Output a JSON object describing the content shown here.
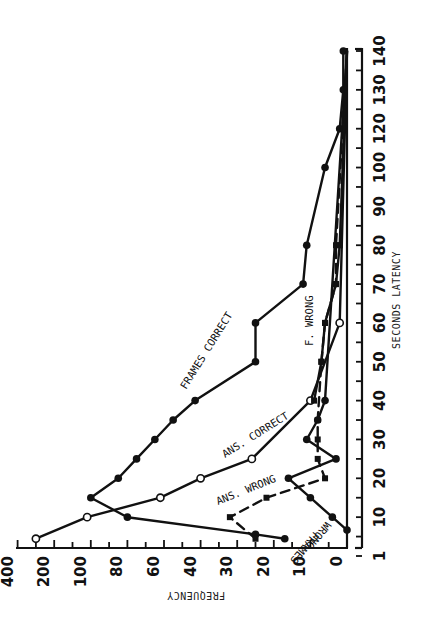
{
  "chart_data": {
    "type": "line",
    "orientation": "rotated 90 degrees clockwise (x-axis vertical on right, y-axis horizontal at bottom)",
    "title": "",
    "xlabel": "SECONDS LATENCY",
    "ylabel": "FREQUENCY",
    "x_tick_labels": [
      "1",
      "10",
      "20",
      "30",
      "40",
      "50",
      "60",
      "70",
      "80",
      "90",
      "100",
      "120",
      "130",
      "140"
    ],
    "y_tick_labels": [
      "0",
      "10",
      "20",
      "30",
      "40",
      "60",
      "80",
      "100",
      "200",
      "400"
    ],
    "y_scale": "nonuniform (tick labels evenly spaced)",
    "xlim": [
      1,
      140
    ],
    "ylim": [
      0,
      400
    ],
    "grid": false,
    "legend": "inline curve labels",
    "series": [
      {
        "name": "FRAMES CORRECT",
        "marker": "filled circle",
        "line": "solid",
        "points": [
          {
            "x": 5,
            "y": 17
          },
          {
            "x": 6,
            "y": 25
          },
          {
            "x": 10,
            "y": 80
          },
          {
            "x": 15,
            "y": 100
          },
          {
            "x": 20,
            "y": 85
          },
          {
            "x": 25,
            "y": 75
          },
          {
            "x": 30,
            "y": 65
          },
          {
            "x": 35,
            "y": 55
          },
          {
            "x": 40,
            "y": 43
          },
          {
            "x": 50,
            "y": 25
          },
          {
            "x": 60,
            "y": 25
          },
          {
            "x": 70,
            "y": 12
          },
          {
            "x": 80,
            "y": 11
          },
          {
            "x": 100,
            "y": 6
          },
          {
            "x": 120,
            "y": 2
          },
          {
            "x": 130,
            "y": 1
          },
          {
            "x": 140,
            "y": 1
          }
        ]
      },
      {
        "name": "ANS. CORRECT",
        "marker": "open circle",
        "line": "solid",
        "points": [
          {
            "x": 5,
            "y": 300
          },
          {
            "x": 10,
            "y": 110
          },
          {
            "x": 15,
            "y": 62
          },
          {
            "x": 20,
            "y": 40
          },
          {
            "x": 25,
            "y": 26
          },
          {
            "x": 40,
            "y": 10
          },
          {
            "x": 60,
            "y": 2
          },
          {
            "x": 140,
            "y": 0
          }
        ]
      },
      {
        "name": "ANS. WRONG",
        "marker": "filled square",
        "line": "dashed",
        "points": [
          {
            "x": 5,
            "y": 25
          },
          {
            "x": 10,
            "y": 32
          },
          {
            "x": 15,
            "y": 22
          },
          {
            "x": 20,
            "y": 6
          },
          {
            "x": 25,
            "y": 8
          },
          {
            "x": 30,
            "y": 8
          },
          {
            "x": 35,
            "y": 8
          },
          {
            "x": 50,
            "y": 7
          },
          {
            "x": 60,
            "y": 6
          },
          {
            "x": 70,
            "y": 3
          },
          {
            "x": 80,
            "y": 3
          },
          {
            "x": 140,
            "y": 0
          }
        ]
      },
      {
        "name": "FRAMES WRONG",
        "marker": "filled circle",
        "line": "solid",
        "points": [
          {
            "x": 7,
            "y": 0
          },
          {
            "x": 10,
            "y": 4
          },
          {
            "x": 15,
            "y": 10
          },
          {
            "x": 20,
            "y": 16
          },
          {
            "x": 25,
            "y": 3
          },
          {
            "x": 30,
            "y": 11
          },
          {
            "x": 35,
            "y": 8
          },
          {
            "x": 40,
            "y": 6
          },
          {
            "x": 140,
            "y": 0
          }
        ]
      },
      {
        "name": "F. WRONG",
        "marker": "filled square",
        "line": "solid",
        "points": [
          {
            "x": 40,
            "y": 9
          },
          {
            "x": 50,
            "y": 7
          },
          {
            "x": 60,
            "y": 6
          },
          {
            "x": 70,
            "y": 3
          },
          {
            "x": 80,
            "y": 2
          },
          {
            "x": 140,
            "y": 0
          }
        ]
      }
    ],
    "annotations": [
      "FRAMES CORRECT",
      "ANS. CORRECT",
      "ANS. WRONG",
      "FRAMES WRONG",
      "F. WRONG"
    ]
  },
  "labels": {
    "xlabel": "SECONDS LATENCY",
    "ylabel": "FREQUENCY",
    "frames_correct": "FRAMES CORRECT",
    "ans_correct": "ANS. CORRECT",
    "ans_wrong": "ANS. WRONG",
    "frames_wrong_1": "FRAMES",
    "frames_wrong_2": "WRONG",
    "f_wrong": "F. WRONG"
  }
}
